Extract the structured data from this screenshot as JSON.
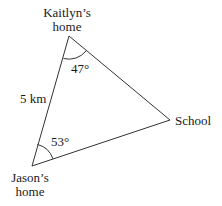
{
  "diagram": {
    "vertices": {
      "kaitlyn": {
        "label_line1": "Kaitlyn’s",
        "label_line2": "home"
      },
      "jason": {
        "label_line1": "Jason’s",
        "label_line2": "home"
      },
      "school": {
        "label": "School"
      }
    },
    "side_label": "5 km",
    "angles": {
      "kaitlyn": "47°",
      "jason": "53°"
    },
    "colors": {
      "line": "#333333",
      "text": "#1a1a1a",
      "background": "#ffffff"
    }
  }
}
